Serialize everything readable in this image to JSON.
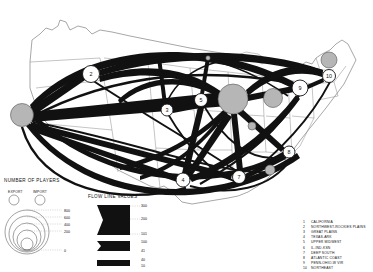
{
  "map": {
    "title": "",
    "type": "flow-map",
    "region": "United States",
    "nodes": [
      {
        "id": 1,
        "label": "1",
        "region": "CALIFORNIA",
        "x": 22,
        "y": 115,
        "r": 11.5,
        "style": "gray"
      },
      {
        "id": 2,
        "label": "2",
        "region": "NORTHWEST-ROCKIES PLAINS",
        "x": 91,
        "y": 74,
        "r": 8.5,
        "style": "open"
      },
      {
        "id": 3,
        "label": "3",
        "region": "GREAT PLAINS",
        "x": 167,
        "y": 110,
        "r": 6.0,
        "style": "open"
      },
      {
        "id": 4,
        "label": "4",
        "region": "TEXAS-ARK",
        "x": 183,
        "y": 180,
        "r": 7.0,
        "style": "open"
      },
      {
        "id": 5,
        "label": "5",
        "region": "UPPER MIDWEST",
        "x": 201,
        "y": 100,
        "r": 6.5,
        "style": "open"
      },
      {
        "id": 6,
        "label": "6",
        "region": "IL-IND-KSN",
        "x": 233,
        "y": 99,
        "r": 15.0,
        "style": "gray"
      },
      {
        "id": 7,
        "label": "7",
        "region": "DEEP SOUTH",
        "x": 239,
        "y": 177,
        "r": 6.5,
        "style": "open"
      },
      {
        "id": 8,
        "label": "8",
        "region": "ATLANTIC COAST",
        "x": 289,
        "y": 152,
        "r": 6.0,
        "style": "open"
      },
      {
        "id": 9,
        "label": "9",
        "region": "PENN-OHIO-W VIR",
        "x": 300,
        "y": 88,
        "r": 8.0,
        "style": "open"
      },
      {
        "id": 10,
        "label": "10",
        "region": "NORTHEAST",
        "x": 329,
        "y": 76,
        "r": 6.5,
        "style": "open"
      }
    ],
    "gray_nodes_extra": [
      {
        "x": 270,
        "y": 170,
        "r": 5.0
      },
      {
        "x": 273,
        "y": 98,
        "r": 9.5
      },
      {
        "x": 329,
        "y": 60,
        "r": 8.0
      },
      {
        "x": 208,
        "y": 58,
        "r": 2.2
      },
      {
        "x": 252,
        "y": 126,
        "r": 4.0
      }
    ],
    "flows": [
      {
        "from": 1,
        "to": 2,
        "value": 300
      },
      {
        "from": 1,
        "to": 6,
        "value": 300
      },
      {
        "from": 1,
        "to": 7,
        "value": 200
      },
      {
        "from": 1,
        "to": 4,
        "value": 150
      },
      {
        "from": 1,
        "to": 9,
        "value": 120
      },
      {
        "from": 2,
        "to": 6,
        "value": 200
      },
      {
        "from": 2,
        "to": 10,
        "value": 90
      },
      {
        "from": 3,
        "to": 6,
        "value": 100
      },
      {
        "from": 4,
        "to": 6,
        "value": 200
      },
      {
        "from": 4,
        "to": 5,
        "value": 120
      },
      {
        "from": 4,
        "to": 9,
        "value": 110
      },
      {
        "from": 5,
        "to": 6,
        "value": 150
      },
      {
        "from": 6,
        "to": 7,
        "value": 200
      },
      {
        "from": 6,
        "to": 8,
        "value": 150
      },
      {
        "from": 6,
        "to": 9,
        "value": 250
      },
      {
        "from": 6,
        "to": 10,
        "value": 180
      },
      {
        "from": 7,
        "to": 8,
        "value": 100
      },
      {
        "from": 9,
        "to": 10,
        "value": 140
      }
    ]
  },
  "legend_circles": {
    "title": "NUMBER OF PLAYERS",
    "export_label": "EXPORT",
    "import_label": "IMPORT",
    "scale_values": [
      "800",
      "600",
      "400",
      "200",
      "0"
    ]
  },
  "legend_flows": {
    "title": "FLOW LINE VALUES",
    "classes": [
      {
        "top": "300",
        "mid": "200",
        "bottom": "101"
      },
      {
        "top": "100",
        "bottom": "41"
      },
      {
        "top": "40",
        "bottom": "10"
      }
    ]
  },
  "region_list": [
    {
      "num": "1",
      "name": "CALIFORNIA"
    },
    {
      "num": "2",
      "name": "NORTHWEST-ROCKIES PLAINS"
    },
    {
      "num": "3",
      "name": "GREAT PLAINS"
    },
    {
      "num": "4",
      "name": "TEXAS-ARK"
    },
    {
      "num": "5",
      "name": "UPPER MIDWEST"
    },
    {
      "num": "6",
      "name": "IL-IND-KSN"
    },
    {
      "num": "7",
      "name": "DEEP SOUTH"
    },
    {
      "num": "8",
      "name": "ATLANTIC COAST"
    },
    {
      "num": "9",
      "name": "PENN-OHIO-W VIR"
    },
    {
      "num": "10",
      "name": "NORTHEAST"
    }
  ],
  "colors": {
    "flow": "#111111",
    "node_fill_gray": "#b6b6b6",
    "node_fill_open": "#ffffff",
    "outline": "#6b6b6b",
    "background": "#ffffff"
  }
}
